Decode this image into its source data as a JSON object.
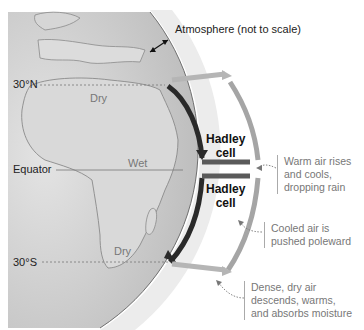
{
  "diagram": {
    "atmosphere_label": "Atmosphere (not to scale)",
    "latitudes": [
      {
        "id": "30n",
        "label": "30°N"
      },
      {
        "id": "equator",
        "label": "Equator"
      },
      {
        "id": "30s",
        "label": "30°S"
      }
    ],
    "regions": [
      {
        "id": "dry-north",
        "label": "Dry"
      },
      {
        "id": "wet",
        "label": "Wet"
      },
      {
        "id": "dry-south",
        "label": "Dry"
      }
    ],
    "cells": [
      {
        "id": "north",
        "line1": "Hadley",
        "line2": "cell"
      },
      {
        "id": "south",
        "line1": "Hadley",
        "line2": "cell"
      }
    ],
    "annotations": [
      {
        "id": "rise",
        "lines": [
          "Warm air rises",
          "and cools,",
          "dropping rain"
        ]
      },
      {
        "id": "poleward",
        "lines": [
          "Cooled air is",
          "pushed poleward"
        ]
      },
      {
        "id": "descend",
        "lines": [
          "Dense, dry air",
          "descends, warms,",
          "and absorbs moisture"
        ]
      }
    ],
    "colors": {
      "globe": "#c9c9c9",
      "land": "#d8d8d8",
      "land_outline": "#8a8a8a",
      "atmosphere": "#ececec",
      "cell_outline": "#8c8c8c",
      "arrow_dark": "#2a2a2a",
      "arrow_light": "#b5b5b5"
    }
  }
}
